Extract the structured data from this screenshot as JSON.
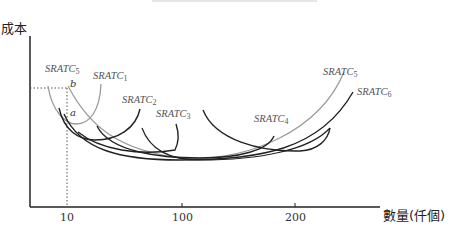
{
  "axes": {
    "y_label": "成本",
    "x_label": "數量(仟個)",
    "x_ticks": [
      {
        "label": "10",
        "x": 67
      },
      {
        "label": "100",
        "x": 182
      },
      {
        "label": "200",
        "x": 295
      }
    ]
  },
  "points": {
    "a": "a",
    "b": "b"
  },
  "curves": [
    {
      "name": "SRATC",
      "sub": "1",
      "color": "#9a9a9a"
    },
    {
      "name": "SRATC",
      "sub": "2",
      "color": "#222222"
    },
    {
      "name": "SRATC",
      "sub": "3",
      "color": "#222222"
    },
    {
      "name": "SRATC",
      "sub": "4",
      "color": "#222222"
    },
    {
      "name": "SRATC",
      "sub": "5",
      "color": "#9a9a9a"
    },
    {
      "name": "SRATC",
      "sub": "6",
      "color": "#222222"
    },
    {
      "name": "SRATC",
      "sub": "5",
      "color": "#9a9a9a"
    }
  ],
  "colors": {
    "axis": "#222222",
    "gray_curve": "#9a9a9a",
    "dark_curve": "#222222"
  }
}
